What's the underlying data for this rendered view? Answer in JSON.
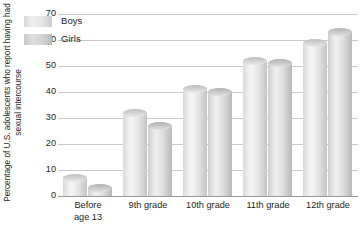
{
  "chart_data": {
    "type": "bar",
    "title": "",
    "xlabel": "",
    "ylabel": "Percentage of U.S. adolescents who report having had sexual intercourse",
    "categories": [
      "Before age 13",
      "9th grade",
      "10th grade",
      "11th grade",
      "12th grade"
    ],
    "series": [
      {
        "name": "Boys",
        "values": [
          7,
          32,
          41,
          52,
          59
        ]
      },
      {
        "name": "Girls",
        "values": [
          3,
          27,
          40,
          51,
          63
        ]
      }
    ],
    "ylim": [
      0,
      70
    ],
    "yticks": [
      0,
      10,
      20,
      30,
      40,
      50,
      60,
      70
    ],
    "ytick_labels": [
      "0",
      "10",
      "20",
      "30",
      "40",
      "50",
      "60",
      "70"
    ],
    "grid": true,
    "legend_position": "top-left-inside",
    "colors": {
      "boys": "#e6e6e6",
      "girls": "#d2d2d2",
      "gridline": "#c9c9c9",
      "axis": "#9a9a9a",
      "text": "#231f20",
      "background": "#ffffff"
    }
  },
  "category_labels_wrapped": [
    [
      "Before",
      "age 13"
    ],
    [
      "9th grade"
    ],
    [
      "10th grade"
    ],
    [
      "11th grade"
    ],
    [
      "12th grade"
    ]
  ]
}
